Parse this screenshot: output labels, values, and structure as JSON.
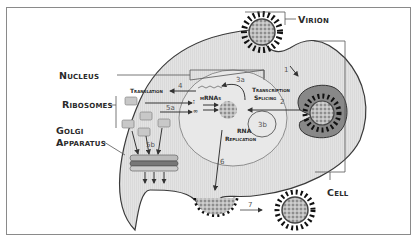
{
  "labels": {
    "virion": "Virion",
    "nucleus": "Nucleus",
    "ribosomes": "Ribosomes",
    "golgi_line1": "Golgi",
    "golgi_line2": "Apparatus",
    "cell": "Cell",
    "translation": "Translation",
    "mrnas": "mRNAs",
    "transcription": "Transcription",
    "splicing": "Splicing",
    "rna": "RNA",
    "replication": "Replication"
  },
  "steps": {
    "s1": "1",
    "s2": "2",
    "s3a": "3a",
    "s3b": "3b",
    "s4": "4",
    "s5a": "5a",
    "s5b": "5b",
    "s6": "6",
    "s7": "7"
  },
  "colors": {
    "cell_fill": "#e4e4e4",
    "outline": "#3a3a3a",
    "frame": "#8a8a8a",
    "virus_core": "#a8a8a8",
    "spike": "#111111"
  }
}
